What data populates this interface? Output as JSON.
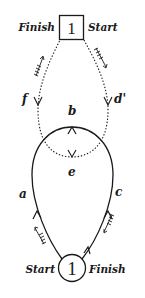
{
  "diagram": {
    "type": "flow-loop",
    "top_node": {
      "shape": "square",
      "number": "1",
      "left_label": "Finish",
      "right_label": "Start"
    },
    "bottom_node": {
      "shape": "circle",
      "number": "1",
      "left_label": "Start",
      "right_label": "Finish"
    },
    "paths": [
      {
        "id": "f",
        "label": "f",
        "style": "dotted",
        "direction": "up-left branch from loop to top node"
      },
      {
        "id": "d",
        "label": "d'",
        "style": "dotted",
        "direction": "down-right branch from top node to loop"
      },
      {
        "id": "a",
        "label": "a",
        "style": "solid",
        "direction": "upward on left side"
      },
      {
        "id": "c",
        "label": "c",
        "style": "solid",
        "direction": "upward on right side"
      },
      {
        "id": "b",
        "label": "b",
        "style": "solid",
        "direction": "top of loop, arrow up"
      },
      {
        "id": "e",
        "label": "e",
        "style": "dotted",
        "direction": "bottom of dotted arc, arrow down"
      }
    ],
    "colors": {
      "stroke": "#1a1a1a",
      "background": "#ffffff"
    }
  }
}
